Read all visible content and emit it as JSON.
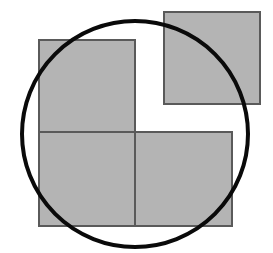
{
  "diagram": {
    "title": "",
    "background": "#ffffff",
    "square_fill": "#b4b4b4",
    "square_stroke": "#5a5a5a",
    "circle_stroke": "#0a0a0a",
    "squares": [
      {
        "id": "top-left",
        "x": 39,
        "y": 40,
        "w": 96,
        "h": 92
      },
      {
        "id": "top-right",
        "x": 164,
        "y": 12,
        "w": 96,
        "h": 92
      },
      {
        "id": "bottom-left",
        "x": 39,
        "y": 132,
        "w": 96,
        "h": 94
      },
      {
        "id": "bottom-right",
        "x": 135,
        "y": 132,
        "w": 97,
        "h": 94
      }
    ],
    "circle": {
      "cx": 135,
      "cy": 134,
      "r": 113,
      "stroke_width": 4
    }
  }
}
